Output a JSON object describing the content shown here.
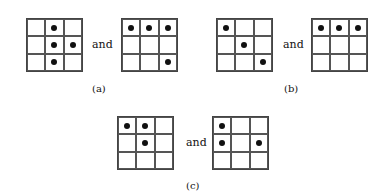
{
  "connector": "and",
  "panels": [
    {
      "label": "(a)",
      "grids": [
        [
          [
            0,
            1,
            0
          ],
          [
            0,
            1,
            1
          ],
          [
            0,
            1,
            0
          ]
        ],
        [
          [
            1,
            1,
            1
          ],
          [
            0,
            0,
            0
          ],
          [
            0,
            0,
            1
          ]
        ]
      ]
    },
    {
      "label": "(b)",
      "grids": [
        [
          [
            1,
            0,
            0
          ],
          [
            0,
            1,
            0
          ],
          [
            0,
            0,
            1
          ]
        ],
        [
          [
            1,
            1,
            1
          ],
          [
            0,
            0,
            0
          ],
          [
            0,
            0,
            0
          ]
        ]
      ]
    },
    {
      "label": "(c)",
      "grids": [
        [
          [
            1,
            1,
            0
          ],
          [
            0,
            1,
            0
          ],
          [
            0,
            0,
            0
          ]
        ],
        [
          [
            1,
            0,
            0
          ],
          [
            1,
            0,
            1
          ],
          [
            0,
            0,
            0
          ]
        ]
      ]
    }
  ]
}
